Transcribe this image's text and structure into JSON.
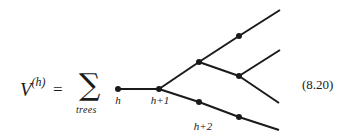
{
  "equation": {
    "lhs_symbol": "V",
    "lhs_superscript": "(h)",
    "equals": "=",
    "sum_symbol": "∑",
    "sum_subscript": "trees",
    "number": "(8.20)"
  },
  "tree": {
    "nodes": [
      {
        "id": "n0",
        "level": "h",
        "label": "h"
      },
      {
        "id": "n1",
        "level": "h+1",
        "label": "h+1"
      },
      {
        "id": "n2a",
        "level": "h+2",
        "label": ""
      },
      {
        "id": "n2b",
        "level": "h+2",
        "label": "h+2"
      },
      {
        "id": "n3a",
        "level": "h+3",
        "label": ""
      },
      {
        "id": "n3b",
        "level": "h+3",
        "label": ""
      },
      {
        "id": "n3c",
        "level": "h+3",
        "label": ""
      }
    ],
    "edges": [
      [
        "n0",
        "n1"
      ],
      [
        "n1",
        "n2a"
      ],
      [
        "n1",
        "n2b"
      ],
      [
        "n2a",
        "n3a"
      ],
      [
        "n2a",
        "n3b"
      ],
      [
        "n2b",
        "n3c"
      ],
      [
        "n3a",
        "leaf1"
      ],
      [
        "n3b",
        "leaf2"
      ],
      [
        "n3b",
        "leaf3"
      ],
      [
        "n3c",
        "leaf4"
      ]
    ],
    "leaf_count": 4
  }
}
